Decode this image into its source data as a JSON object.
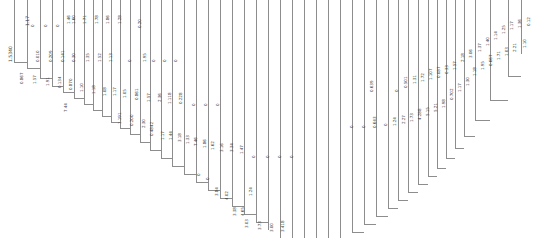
{
  "figure": {
    "type": "dendrogram",
    "title": "",
    "orientation": "vertical-leaves",
    "background_color": "#ffffff",
    "line_color": "#8d8d8d",
    "label_color": "#3a3a3a",
    "width": 533,
    "height": 238
  },
  "chart_data": {
    "type": "line",
    "title": "",
    "subtitle": "",
    "xlabel": "",
    "ylabel": "",
    "grid": false,
    "legend": "none",
    "axis_note": "no drawn axes or tick marks",
    "categories": [],
    "values": [],
    "branch_count": 45,
    "branch_x": [
      14,
      27,
      40,
      52,
      63,
      74,
      84,
      93,
      102,
      111,
      120,
      130,
      140,
      150,
      161,
      172,
      184,
      196,
      208,
      220,
      232,
      244,
      256,
      268,
      280,
      292,
      304,
      316,
      328,
      340,
      352,
      364,
      376,
      388,
      398,
      408,
      418,
      428,
      437,
      446,
      455,
      464,
      475,
      490,
      508,
      521
    ],
    "branch_depth": [
      62,
      68,
      78,
      86,
      92,
      98,
      104,
      110,
      116,
      122,
      128,
      134,
      142,
      150,
      158,
      166,
      174,
      182,
      190,
      198,
      206,
      214,
      222,
      230,
      238,
      238,
      238,
      238,
      238,
      238,
      232,
      224,
      216,
      208,
      200,
      192,
      184,
      176,
      168,
      158,
      148,
      136,
      120,
      100,
      76,
      54
    ],
    "labels": [
      {
        "text": "1.5340",
        "x": 9,
        "y": 62,
        "size": "big"
      },
      {
        "text": "1.17",
        "x": 26,
        "y": 26,
        "size": "big"
      },
      {
        "text": "0.867",
        "x": 20,
        "y": 84,
        "size": "normal"
      },
      {
        "text": "0",
        "x": 31,
        "y": 27,
        "size": "normal"
      },
      {
        "text": "0.010",
        "x": 36,
        "y": 62,
        "size": "normal"
      },
      {
        "text": "1.57",
        "x": 33,
        "y": 84,
        "size": "normal"
      },
      {
        "text": "0",
        "x": 44,
        "y": 27,
        "size": "normal"
      },
      {
        "text": "0.209",
        "x": 49,
        "y": 62,
        "size": "normal"
      },
      {
        "text": "1.91",
        "x": 46,
        "y": 86,
        "size": "normal"
      },
      {
        "text": "0",
        "x": 56,
        "y": 27,
        "size": "normal"
      },
      {
        "text": "0.141",
        "x": 61,
        "y": 62,
        "size": "normal"
      },
      {
        "text": "0.134",
        "x": 58,
        "y": 88,
        "size": "normal"
      },
      {
        "text": "1.46",
        "x": 67,
        "y": 24,
        "size": "normal"
      },
      {
        "text": "1.60",
        "x": 72,
        "y": 24,
        "size": "normal"
      },
      {
        "text": "0.30",
        "x": 72,
        "y": 62,
        "size": "normal"
      },
      {
        "text": "0.870",
        "x": 69,
        "y": 90,
        "size": "normal"
      },
      {
        "text": "7.44",
        "x": 64,
        "y": 112,
        "size": "normal"
      },
      {
        "text": "1.71",
        "x": 83,
        "y": 24,
        "size": "normal"
      },
      {
        "text": "1.35",
        "x": 86,
        "y": 62,
        "size": "normal"
      },
      {
        "text": "1.10",
        "x": 80,
        "y": 92,
        "size": "normal"
      },
      {
        "text": "1.78",
        "x": 95,
        "y": 24,
        "size": "normal"
      },
      {
        "text": "1.52",
        "x": 98,
        "y": 62,
        "size": "normal"
      },
      {
        "text": "1.18",
        "x": 92,
        "y": 94,
        "size": "normal"
      },
      {
        "text": "1.86",
        "x": 106,
        "y": 24,
        "size": "normal"
      },
      {
        "text": "1.13",
        "x": 109,
        "y": 62,
        "size": "normal"
      },
      {
        "text": "1.08",
        "x": 103,
        "y": 96,
        "size": "normal"
      },
      {
        "text": "1.28",
        "x": 118,
        "y": 24,
        "size": "normal"
      },
      {
        "text": "1.17",
        "x": 113,
        "y": 96,
        "size": "normal"
      },
      {
        "text": "0",
        "x": 128,
        "y": 62,
        "size": "normal"
      },
      {
        "text": "1.05",
        "x": 123,
        "y": 98,
        "size": "normal"
      },
      {
        "text": "1.191",
        "x": 118,
        "y": 124,
        "size": "normal"
      },
      {
        "text": "0.20",
        "x": 138,
        "y": 28,
        "size": "normal"
      },
      {
        "text": "1.95",
        "x": 143,
        "y": 62,
        "size": "normal"
      },
      {
        "text": "0.861",
        "x": 135,
        "y": 100,
        "size": "normal"
      },
      {
        "text": "0.200",
        "x": 130,
        "y": 126,
        "size": "normal"
      },
      {
        "text": "0",
        "x": 152,
        "y": 62,
        "size": "normal"
      },
      {
        "text": "1.57",
        "x": 147,
        "y": 102,
        "size": "normal"
      },
      {
        "text": "2.30",
        "x": 142,
        "y": 128,
        "size": "normal"
      },
      {
        "text": "0",
        "x": 163,
        "y": 62,
        "size": "normal"
      },
      {
        "text": "2.36",
        "x": 158,
        "y": 102,
        "size": "normal"
      },
      {
        "text": "0.4842",
        "x": 150,
        "y": 136,
        "size": "normal"
      },
      {
        "text": "0",
        "x": 174,
        "y": 62,
        "size": "normal"
      },
      {
        "text": "1.118",
        "x": 168,
        "y": 104,
        "size": "normal"
      },
      {
        "text": "1.17",
        "x": 161,
        "y": 140,
        "size": "normal"
      },
      {
        "text": "0.228",
        "x": 179,
        "y": 104,
        "size": "normal"
      },
      {
        "text": "1.44",
        "x": 169,
        "y": 140,
        "size": "normal"
      },
      {
        "text": "0",
        "x": 192,
        "y": 106,
        "size": "normal"
      },
      {
        "text": "3.18",
        "x": 178,
        "y": 142,
        "size": "normal"
      },
      {
        "text": "0",
        "x": 204,
        "y": 106,
        "size": "normal"
      },
      {
        "text": "1.33",
        "x": 186,
        "y": 144,
        "size": "normal"
      },
      {
        "text": "0",
        "x": 216,
        "y": 106,
        "size": "normal"
      },
      {
        "text": "7.46",
        "x": 194,
        "y": 146,
        "size": "normal"
      },
      {
        "text": "1.86",
        "x": 203,
        "y": 148,
        "size": "normal"
      },
      {
        "text": "0",
        "x": 197,
        "y": 176,
        "size": "normal"
      },
      {
        "text": "1.62",
        "x": 211,
        "y": 150,
        "size": "normal"
      },
      {
        "text": "0",
        "x": 206,
        "y": 180,
        "size": "normal"
      },
      {
        "text": "3.16",
        "x": 220,
        "y": 152,
        "size": "normal"
      },
      {
        "text": "3.84",
        "x": 215,
        "y": 196,
        "size": "normal"
      },
      {
        "text": "3.34",
        "x": 230,
        "y": 152,
        "size": "normal"
      },
      {
        "text": "4.02",
        "x": 225,
        "y": 200,
        "size": "normal"
      },
      {
        "text": "1.47",
        "x": 240,
        "y": 154,
        "size": "normal"
      },
      {
        "text": "3.38",
        "x": 233,
        "y": 216,
        "size": "normal"
      },
      {
        "text": "4.65",
        "x": 241,
        "y": 216,
        "size": "normal"
      },
      {
        "text": "0",
        "x": 252,
        "y": 158,
        "size": "normal"
      },
      {
        "text": "1.24",
        "x": 249,
        "y": 196,
        "size": "normal"
      },
      {
        "text": "3.03",
        "x": 245,
        "y": 228,
        "size": "normal"
      },
      {
        "text": "0",
        "x": 266,
        "y": 158,
        "size": "normal"
      },
      {
        "text": "3.73",
        "x": 258,
        "y": 230,
        "size": "normal"
      },
      {
        "text": "0",
        "x": 278,
        "y": 158,
        "size": "normal"
      },
      {
        "text": "3.00",
        "x": 270,
        "y": 232,
        "size": "normal"
      },
      {
        "text": "0",
        "x": 290,
        "y": 158,
        "size": "normal"
      },
      {
        "text": "3.418",
        "x": 281,
        "y": 232,
        "size": "normal"
      },
      {
        "text": "0",
        "x": 350,
        "y": 128,
        "size": "normal"
      },
      {
        "text": "0",
        "x": 362,
        "y": 128,
        "size": "normal"
      },
      {
        "text": "0.643",
        "x": 373,
        "y": 128,
        "size": "normal"
      },
      {
        "text": "0.639",
        "x": 370,
        "y": 92,
        "size": "normal"
      },
      {
        "text": "0",
        "x": 384,
        "y": 126,
        "size": "normal"
      },
      {
        "text": "1.24",
        "x": 393,
        "y": 126,
        "size": "normal"
      },
      {
        "text": "0",
        "x": 395,
        "y": 92,
        "size": "normal"
      },
      {
        "text": "2.27",
        "x": 402,
        "y": 124,
        "size": "normal"
      },
      {
        "text": "0.501",
        "x": 404,
        "y": 88,
        "size": "normal"
      },
      {
        "text": "1.73",
        "x": 410,
        "y": 122,
        "size": "normal"
      },
      {
        "text": "1.31",
        "x": 413,
        "y": 84,
        "size": "normal"
      },
      {
        "text": "4.288",
        "x": 418,
        "y": 120,
        "size": "normal"
      },
      {
        "text": "1.72",
        "x": 421,
        "y": 82,
        "size": "normal"
      },
      {
        "text": "5.15",
        "x": 426,
        "y": 116,
        "size": "normal"
      },
      {
        "text": "1.107",
        "x": 429,
        "y": 80,
        "size": "normal"
      },
      {
        "text": "5.21",
        "x": 434,
        "y": 112,
        "size": "normal"
      },
      {
        "text": "0.087",
        "x": 437,
        "y": 78,
        "size": "normal"
      },
      {
        "text": "1.98",
        "x": 442,
        "y": 108,
        "size": "normal"
      },
      {
        "text": "0.33",
        "x": 445,
        "y": 74,
        "size": "normal"
      },
      {
        "text": "0.702",
        "x": 450,
        "y": 100,
        "size": "normal"
      },
      {
        "text": "1.57",
        "x": 453,
        "y": 70,
        "size": "normal"
      },
      {
        "text": "1.17",
        "x": 458,
        "y": 92,
        "size": "normal"
      },
      {
        "text": "2.18",
        "x": 461,
        "y": 62,
        "size": "normal"
      },
      {
        "text": "1.30",
        "x": 466,
        "y": 86,
        "size": "normal"
      },
      {
        "text": "3.06",
        "x": 469,
        "y": 58,
        "size": "normal"
      },
      {
        "text": "1.18",
        "x": 473,
        "y": 76,
        "size": "normal"
      },
      {
        "text": "1.37",
        "x": 478,
        "y": 52,
        "size": "normal"
      },
      {
        "text": "1.95",
        "x": 481,
        "y": 70,
        "size": "normal"
      },
      {
        "text": "1.40",
        "x": 486,
        "y": 46,
        "size": "normal"
      },
      {
        "text": "0.667",
        "x": 489,
        "y": 66,
        "size": "normal"
      },
      {
        "text": "1.14",
        "x": 494,
        "y": 40,
        "size": "normal"
      },
      {
        "text": "1.71",
        "x": 497,
        "y": 60,
        "size": "normal"
      },
      {
        "text": "1.25",
        "x": 502,
        "y": 34,
        "size": "normal"
      },
      {
        "text": "1.03",
        "x": 505,
        "y": 56,
        "size": "normal"
      },
      {
        "text": "1.17",
        "x": 510,
        "y": 30,
        "size": "normal"
      },
      {
        "text": "2.21",
        "x": 513,
        "y": 52,
        "size": "normal"
      },
      {
        "text": "1.36",
        "x": 518,
        "y": 28,
        "size": "normal"
      },
      {
        "text": "1.10",
        "x": 523,
        "y": 48,
        "size": "normal"
      },
      {
        "text": "0.12",
        "x": 527,
        "y": 26,
        "size": "normal"
      }
    ],
    "connectors": [
      {
        "x": 14,
        "y": 62,
        "w": 13
      },
      {
        "x": 27,
        "y": 68,
        "w": 13
      },
      {
        "x": 40,
        "y": 78,
        "w": 12
      },
      {
        "x": 52,
        "y": 86,
        "w": 11
      },
      {
        "x": 63,
        "y": 92,
        "w": 11
      },
      {
        "x": 74,
        "y": 98,
        "w": 10
      },
      {
        "x": 84,
        "y": 104,
        "w": 9
      },
      {
        "x": 93,
        "y": 110,
        "w": 9
      },
      {
        "x": 102,
        "y": 116,
        "w": 9
      },
      {
        "x": 111,
        "y": 122,
        "w": 9
      },
      {
        "x": 120,
        "y": 128,
        "w": 10
      },
      {
        "x": 130,
        "y": 134,
        "w": 10
      },
      {
        "x": 140,
        "y": 142,
        "w": 10
      },
      {
        "x": 150,
        "y": 150,
        "w": 11
      },
      {
        "x": 161,
        "y": 158,
        "w": 11
      },
      {
        "x": 172,
        "y": 166,
        "w": 12
      },
      {
        "x": 184,
        "y": 174,
        "w": 12
      },
      {
        "x": 196,
        "y": 182,
        "w": 12
      },
      {
        "x": 208,
        "y": 190,
        "w": 12
      },
      {
        "x": 220,
        "y": 198,
        "w": 12
      },
      {
        "x": 232,
        "y": 206,
        "w": 12
      },
      {
        "x": 244,
        "y": 214,
        "w": 12
      },
      {
        "x": 256,
        "y": 222,
        "w": 12
      },
      {
        "x": 352,
        "y": 232,
        "w": 12
      },
      {
        "x": 364,
        "y": 224,
        "w": 12
      },
      {
        "x": 376,
        "y": 216,
        "w": 12
      },
      {
        "x": 388,
        "y": 208,
        "w": 10
      },
      {
        "x": 398,
        "y": 200,
        "w": 10
      },
      {
        "x": 408,
        "y": 192,
        "w": 10
      },
      {
        "x": 418,
        "y": 184,
        "w": 10
      },
      {
        "x": 428,
        "y": 176,
        "w": 9
      },
      {
        "x": 437,
        "y": 168,
        "w": 9
      },
      {
        "x": 446,
        "y": 158,
        "w": 9
      },
      {
        "x": 455,
        "y": 148,
        "w": 9
      },
      {
        "x": 464,
        "y": 136,
        "w": 11
      },
      {
        "x": 475,
        "y": 120,
        "w": 15
      },
      {
        "x": 490,
        "y": 100,
        "w": 18
      },
      {
        "x": 508,
        "y": 76,
        "w": 13
      }
    ]
  }
}
